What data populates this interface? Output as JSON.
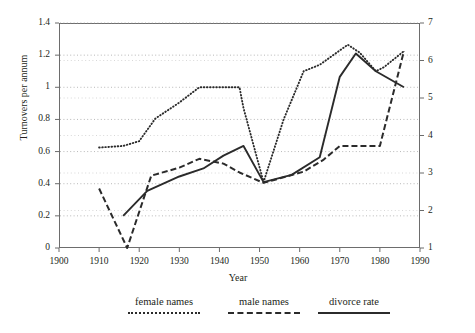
{
  "chart_data": {
    "type": "line",
    "title": "",
    "xlabel": "Year",
    "ylabel": "Turnovers per annum",
    "ylabel_right": "Divorce rate per 1,00 inhabitants",
    "xlim": [
      1900,
      1990
    ],
    "ylim": [
      0,
      1.4
    ],
    "ylim_right": [
      1,
      7
    ],
    "xticks": [
      1900,
      1910,
      1920,
      1930,
      1940,
      1950,
      1960,
      1970,
      1980,
      1990
    ],
    "yticks": [
      0,
      0.2,
      0.4,
      0.6,
      0.8,
      1,
      1.2,
      1.4
    ],
    "yticks_right": [
      1,
      2,
      3,
      4,
      5,
      6,
      7
    ],
    "grid": "horizontal-dotted",
    "legend_position": "bottom",
    "series": [
      {
        "name": "female names",
        "style": "dotted",
        "axis": "left",
        "points": [
          [
            1910,
            0.625
          ],
          [
            1916,
            0.635
          ],
          [
            1920,
            0.665
          ],
          [
            1924,
            0.805
          ],
          [
            1930,
            0.905
          ],
          [
            1935,
            1.0
          ],
          [
            1940,
            1.0
          ],
          [
            1945,
            1.0
          ],
          [
            1946,
            0.87
          ],
          [
            1951,
            0.41
          ],
          [
            1956,
            0.8
          ],
          [
            1961,
            1.1
          ],
          [
            1965,
            1.14
          ],
          [
            1972,
            1.265
          ],
          [
            1975,
            1.215
          ],
          [
            1979,
            1.1
          ],
          [
            1981,
            1.125
          ],
          [
            1986,
            1.225
          ]
        ]
      },
      {
        "name": "male names",
        "style": "dashed",
        "axis": "left",
        "points": [
          [
            1910,
            0.37
          ],
          [
            1917,
            0.0
          ],
          [
            1923,
            0.45
          ],
          [
            1930,
            0.5
          ],
          [
            1935,
            0.555
          ],
          [
            1941,
            0.525
          ],
          [
            1945,
            0.47
          ],
          [
            1951,
            0.405
          ],
          [
            1956,
            0.44
          ],
          [
            1961,
            0.475
          ],
          [
            1966,
            0.55
          ],
          [
            1970,
            0.635
          ],
          [
            1975,
            0.635
          ],
          [
            1980,
            0.635
          ],
          [
            1986,
            1.225
          ]
        ]
      },
      {
        "name": "divorce rate",
        "style": "solid",
        "axis": "right",
        "points": [
          [
            1916,
            0.2
          ],
          [
            1922,
            0.355
          ],
          [
            1930,
            0.445
          ],
          [
            1936,
            0.495
          ],
          [
            1941,
            0.575
          ],
          [
            1946,
            0.635
          ],
          [
            1951,
            0.41
          ],
          [
            1958,
            0.455
          ],
          [
            1965,
            0.565
          ],
          [
            1970,
            1.065
          ],
          [
            1974,
            1.21
          ],
          [
            1979,
            1.1
          ],
          [
            1986,
            1.0
          ]
        ]
      }
    ]
  },
  "legend": {
    "items": [
      {
        "label": "female names",
        "style": "dotted"
      },
      {
        "label": "male names",
        "style": "dashed"
      },
      {
        "label": "divorce rate",
        "style": "solid"
      }
    ]
  }
}
